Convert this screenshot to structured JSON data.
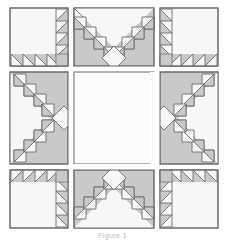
{
  "figure": {
    "caption": "Figure 1",
    "colors": {
      "background": "#ffffff",
      "block_light": "#f7f7f5",
      "block_shade": "#c9c9c9",
      "center_white": "#fcfcfc",
      "outline": "#6b6b6b",
      "outline_light": "#8d8d8d"
    },
    "grid": {
      "rows": 3,
      "cols": 3,
      "gap_px": 6,
      "origin_x": 10,
      "origin_y": 8,
      "col_widths": [
        58,
        80,
        58
      ],
      "row_heights": [
        58,
        92,
        58
      ]
    },
    "blocks": [
      {
        "name": "top-left-corner-block",
        "row": 0,
        "col": 0,
        "pattern": "corner-sawtooth",
        "orientation": "top-left",
        "sawtooth_count": 4
      },
      {
        "name": "top-center-chevron-block",
        "row": 0,
        "col": 1,
        "pattern": "chevron-v",
        "orientation": "point-down",
        "sawtooth_count": 5
      },
      {
        "name": "top-right-corner-block",
        "row": 0,
        "col": 2,
        "pattern": "corner-sawtooth",
        "orientation": "top-right",
        "sawtooth_count": 4
      },
      {
        "name": "middle-left-chevron-block",
        "row": 1,
        "col": 0,
        "pattern": "chevron-v",
        "orientation": "point-right",
        "sawtooth_count": 5
      },
      {
        "name": "center-plain-block",
        "row": 1,
        "col": 1,
        "pattern": "plain",
        "orientation": "none",
        "sawtooth_count": 0
      },
      {
        "name": "middle-right-chevron-block",
        "row": 1,
        "col": 2,
        "pattern": "chevron-v",
        "orientation": "point-left",
        "sawtooth_count": 5
      },
      {
        "name": "bottom-left-corner-block",
        "row": 2,
        "col": 0,
        "pattern": "corner-sawtooth",
        "orientation": "bottom-left",
        "sawtooth_count": 4
      },
      {
        "name": "bottom-center-chevron-block",
        "row": 2,
        "col": 1,
        "pattern": "chevron-v",
        "orientation": "point-up",
        "sawtooth_count": 5
      },
      {
        "name": "bottom-right-corner-block",
        "row": 2,
        "col": 2,
        "pattern": "corner-sawtooth",
        "orientation": "bottom-right",
        "sawtooth_count": 4
      }
    ]
  }
}
